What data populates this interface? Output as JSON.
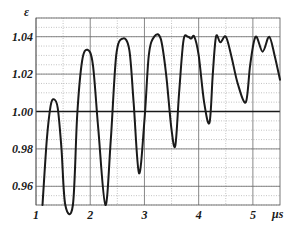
{
  "chart_data": {
    "type": "line",
    "title": "",
    "xlabel": "μs",
    "ylabel": "ε",
    "xlim": [
      1.0,
      5.5
    ],
    "ylim": [
      0.95,
      1.05
    ],
    "x_ticks": [
      1,
      2,
      3,
      4,
      5
    ],
    "x_tick_labels": [
      "1",
      "2",
      "3",
      "4",
      "5"
    ],
    "y_ticks": [
      0.96,
      0.98,
      1.0,
      1.02,
      1.04
    ],
    "y_tick_labels": [
      "0.96",
      "0.98",
      "1.00",
      "1.02",
      "1.04"
    ],
    "grid": true,
    "reference_line": 1.0,
    "legend": null,
    "series": [
      {
        "name": "ε(t)",
        "color": "#1a1a1a",
        "points": [
          [
            1.12,
            0.95
          ],
          [
            1.2,
            0.985
          ],
          [
            1.27,
            1.003
          ],
          [
            1.33,
            1.0065
          ],
          [
            1.4,
            1.002
          ],
          [
            1.47,
            0.98
          ],
          [
            1.54,
            0.95
          ],
          [
            1.68,
            0.95
          ],
          [
            1.76,
            0.998
          ],
          [
            1.85,
            1.027
          ],
          [
            1.95,
            1.033
          ],
          [
            2.05,
            1.025
          ],
          [
            2.15,
            0.99
          ],
          [
            2.28,
            0.948
          ],
          [
            2.38,
            0.985
          ],
          [
            2.48,
            1.03
          ],
          [
            2.6,
            1.039
          ],
          [
            2.72,
            1.033
          ],
          [
            2.8,
            1.005
          ],
          [
            2.9,
            0.967
          ],
          [
            3.0,
            0.995
          ],
          [
            3.08,
            1.03
          ],
          [
            3.18,
            1.04
          ],
          [
            3.3,
            1.039
          ],
          [
            3.4,
            1.02
          ],
          [
            3.5,
            0.99
          ],
          [
            3.57,
            0.982
          ],
          [
            3.64,
            1.01
          ],
          [
            3.72,
            1.038
          ],
          [
            3.8,
            1.04
          ],
          [
            3.86,
            1.039
          ],
          [
            3.92,
            1.04
          ],
          [
            4.0,
            1.03
          ],
          [
            4.1,
            1.005
          ],
          [
            4.2,
            0.994
          ],
          [
            4.26,
            1.02
          ],
          [
            4.32,
            1.04
          ],
          [
            4.4,
            1.037
          ],
          [
            4.5,
            1.04
          ],
          [
            4.6,
            1.03
          ],
          [
            4.72,
            1.015
          ],
          [
            4.87,
            1.005
          ],
          [
            4.95,
            1.025
          ],
          [
            5.05,
            1.04
          ],
          [
            5.18,
            1.032
          ],
          [
            5.3,
            1.04
          ],
          [
            5.4,
            1.03
          ],
          [
            5.5,
            1.017
          ]
        ]
      }
    ]
  }
}
